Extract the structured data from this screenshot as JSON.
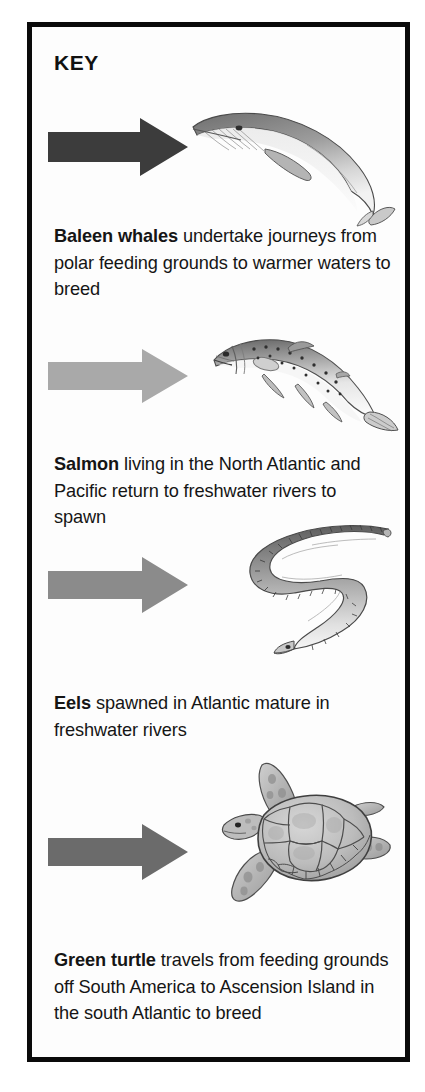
{
  "panel": {
    "title": "KEY",
    "border_color": "#0a0a0a",
    "background_color": "#fdfdfd"
  },
  "entries": [
    {
      "id": "whale",
      "animal_label": "Baleen whales",
      "description": " undertake journeys from polar feeding grounds to warmer waters to breed",
      "full_text": "Baleen whales undertake journeys from polar feeding grounds to warmer waters to breed",
      "arrow_color": "#3c3c3c",
      "arrow_name": "arrow-right-icon",
      "illustration_name": "baleen-whale-illustration"
    },
    {
      "id": "salmon",
      "animal_label": "Salmon",
      "description": " living in the North Atlantic and Pacific return to freshwater rivers to spawn",
      "full_text": "Salmon living in the North Atlantic and Pacific return to freshwater rivers to spawn",
      "arrow_color": "#a9a9a9",
      "arrow_name": "arrow-right-icon",
      "illustration_name": "salmon-illustration"
    },
    {
      "id": "eel",
      "animal_label": "Eels",
      "description": " spawned in Atlantic mature in freshwater rivers",
      "full_text": "Eels spawned in Atlantic mature in freshwater rivers",
      "arrow_color": "#8b8b8b",
      "arrow_name": "arrow-right-icon",
      "illustration_name": "eel-illustration"
    },
    {
      "id": "turtle",
      "animal_label": "Green turtle",
      "description": " travels from feeding grounds off South America to Ascension Island in the south Atlantic to breed",
      "full_text": "Green turtle travels from feeding grounds off South America to Ascension Island in the south Atlantic to breed",
      "arrow_color": "#6b6b6b",
      "arrow_name": "arrow-right-icon",
      "illustration_name": "green-turtle-illustration"
    }
  ]
}
